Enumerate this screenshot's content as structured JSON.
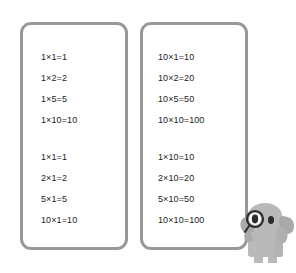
{
  "page": {
    "background_color": "#ffffff",
    "card_border_color": "#989898",
    "text_color": "#1c1c1c"
  },
  "cards": [
    {
      "name": "left-card",
      "groups": [
        {
          "name": "ones-times-table",
          "lines": [
            "1×1=1",
            "1×2=2",
            "1×5=5",
            "1×10=10"
          ]
        },
        {
          "name": "times-one-table",
          "lines": [
            "1×1=1",
            "2×1=2",
            "5×1=5",
            "10×1=10"
          ]
        }
      ]
    },
    {
      "name": "right-card",
      "groups": [
        {
          "name": "tens-times-table",
          "lines": [
            "10×1=10",
            "10×2=20",
            "10×5=50",
            "10×10=100"
          ]
        },
        {
          "name": "times-ten-table",
          "lines": [
            "1×10=10",
            "2×10=20",
            "5×10=50",
            "10×10=100"
          ]
        }
      ]
    }
  ],
  "mascot": {
    "name": "elephant-with-monocle",
    "body_color": "#b9b9b9",
    "shade_color": "#a0a0a0",
    "eye_color": "#2b2b2b"
  }
}
